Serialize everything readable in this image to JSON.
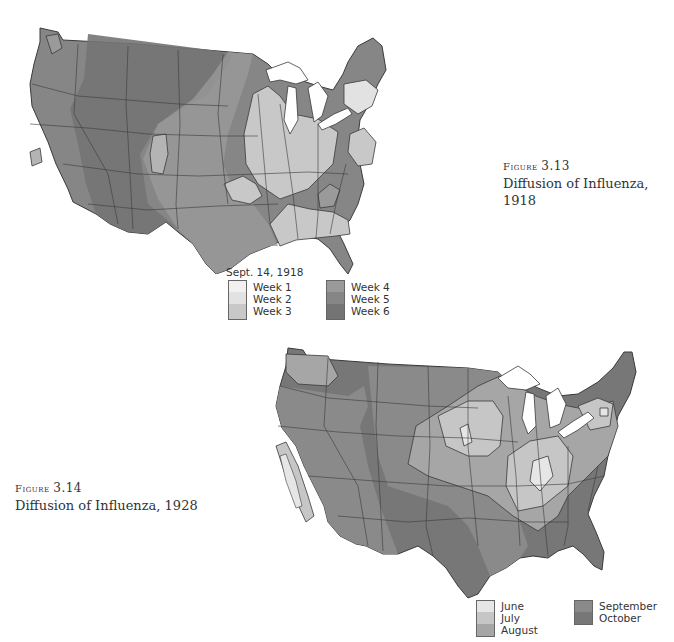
{
  "figures": [
    {
      "id": "fig-3-13",
      "label": "Figure 3.13",
      "label_word": "Figure",
      "label_number": "3.13",
      "title": "Diffusion of Influenza, 1918",
      "legend": {
        "title": "Sept. 14, 1918",
        "columns": [
          [
            {
              "label": "Week 1",
              "color": "#f1f1f1"
            },
            {
              "label": "Week 2",
              "color": "#e2e2e2"
            },
            {
              "label": "Week 3",
              "color": "#c8c8c8"
            }
          ],
          [
            {
              "label": "Week 4",
              "color": "#9a9a9a"
            },
            {
              "label": "Week 5",
              "color": "#868686"
            },
            {
              "label": "Week 6",
              "color": "#747474"
            }
          ]
        ]
      }
    },
    {
      "id": "fig-3-14",
      "label": "Figure 3.14",
      "label_word": "Figure",
      "label_number": "3.14",
      "title": "Diffusion of Influenza, 1928",
      "legend": {
        "title": "",
        "columns": [
          [
            {
              "label": "June",
              "color": "#e6e6e6"
            },
            {
              "label": "July",
              "color": "#c6c6c6"
            },
            {
              "label": "August",
              "color": "#a6a6a6"
            }
          ],
          [
            {
              "label": "September",
              "color": "#8a8a8a"
            },
            {
              "label": "October",
              "color": "#777777"
            }
          ]
        ]
      }
    }
  ],
  "colors": {
    "water": "#ffffff",
    "border": "#3a3a3a"
  }
}
